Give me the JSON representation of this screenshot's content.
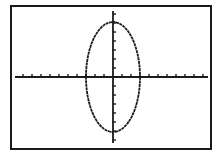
{
  "screen": {
    "frame": {
      "x": 11,
      "y": 6,
      "w": 200,
      "h": 143
    },
    "colors": {
      "background": "#ffffff",
      "ink": "#1a1a1a"
    }
  },
  "chart_data": {
    "type": "line",
    "title": "",
    "xlabel": "",
    "ylabel": "",
    "grid": false,
    "axes": {
      "x_tick_spacing_px": 9,
      "y_tick_spacing_px": 9
    },
    "ellipse": {
      "cx": 0,
      "cy": 0,
      "semi_x_ticks": 3,
      "semi_y_ticks": 6
    },
    "pixel_layout": {
      "origin": {
        "x": 113,
        "y": 77
      },
      "x_axis": {
        "x0": 15,
        "x1": 208
      },
      "y_axis": {
        "y0": 11,
        "y1": 143
      },
      "ellipse_rx": 27,
      "ellipse_ry": 55
    }
  }
}
